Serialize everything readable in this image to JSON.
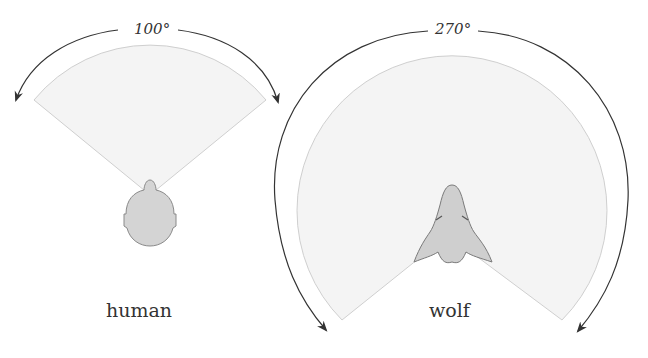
{
  "diagram": {
    "colors": {
      "sector_fill": "#f4f4f4",
      "sector_stroke": "#cfcfcf",
      "head_fill": "#d2d2d2",
      "head_stroke": "#8a8a8a",
      "arrow": "#333333",
      "text": "#333333"
    },
    "panels": [
      {
        "id": "human",
        "name": "human",
        "angle_label": "100°",
        "field_of_view_deg": 100
      },
      {
        "id": "wolf",
        "name": "wolf",
        "angle_label": "270°",
        "field_of_view_deg": 270
      }
    ]
  }
}
